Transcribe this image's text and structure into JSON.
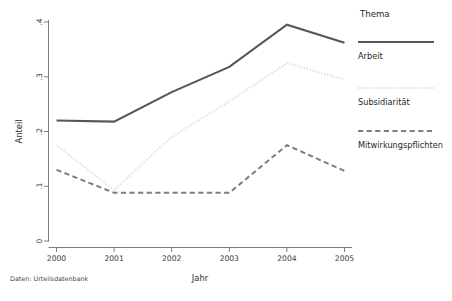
{
  "chart_data": {
    "type": "line",
    "title": "",
    "xlabel": "Jahr",
    "ylabel": "Anteil",
    "x": [
      2000,
      2001,
      2002,
      2003,
      2004,
      2005
    ],
    "categories": [
      "2000",
      "2001",
      "2002",
      "2003",
      "2004",
      "2005"
    ],
    "xlim": [
      2000,
      2005
    ],
    "ylim": [
      0,
      0.4
    ],
    "yticks": [
      0,
      0.1,
      0.2,
      0.3,
      0.4
    ],
    "ytick_labels": [
      "0",
      ".1",
      ".2",
      ".3",
      ".4"
    ],
    "xtick_labels": [
      "2000",
      "2001",
      "2002",
      "2003",
      "2004",
      "2005"
    ],
    "grid": false,
    "legend_position": "right",
    "legend_title": "Thema",
    "series": [
      {
        "name": "Arbeit",
        "style": "solid",
        "color": "#575757",
        "width": 2.1,
        "values": [
          0.22,
          0.218,
          0.272,
          0.318,
          0.395,
          0.362
        ]
      },
      {
        "name": "Subsidiarität",
        "style": "dotted",
        "color": "#d6d6d6",
        "width": 2.0,
        "values": [
          0.175,
          0.093,
          0.19,
          0.255,
          0.325,
          0.295
        ]
      },
      {
        "name": "Mitwirkungspflichten",
        "style": "dashed",
        "color": "#7d7d7d",
        "width": 2.0,
        "values": [
          0.13,
          0.088,
          0.088,
          0.088,
          0.175,
          0.128
        ]
      }
    ],
    "note": "Daten: Urteilsdatenbank"
  },
  "axes": {
    "y_title": "Anteil",
    "x_title": "Jahr",
    "y_ticks": [
      {
        "label": ".4"
      },
      {
        "label": ".3"
      },
      {
        "label": ".2"
      },
      {
        "label": ".1"
      },
      {
        "label": "0"
      }
    ],
    "x_ticks": [
      {
        "label": "2000"
      },
      {
        "label": "2001"
      },
      {
        "label": "2002"
      },
      {
        "label": "2003"
      },
      {
        "label": "2004"
      },
      {
        "label": "2005"
      }
    ]
  },
  "legend": {
    "title": "Thema",
    "entries": [
      {
        "label": "Arbeit"
      },
      {
        "label": "Subsidiarität"
      },
      {
        "label": "Mitwirkungspflichten"
      }
    ]
  },
  "footnote": {
    "text": "Daten: Urteilsdatenbank"
  },
  "colors": {
    "series_arbeit": "#575757",
    "series_subsidiaritaet": "#d6d6d6",
    "series_mitwirkungspflichten": "#7d7d7d",
    "axis": "#6f6f6f",
    "background": "#ffffff"
  }
}
